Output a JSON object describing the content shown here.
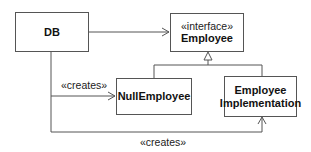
{
  "diagram": {
    "type": "uml-class-diagram",
    "classes": [
      {
        "id": "db",
        "name": "DB"
      },
      {
        "id": "employee",
        "stereotype": "«interface»",
        "name": "Employee"
      },
      {
        "id": "null_employee",
        "name": "NullEmployee"
      },
      {
        "id": "employee_impl",
        "name_line1": "Employee",
        "name_line2": "Implementation"
      }
    ],
    "relations": [
      {
        "from": "DB",
        "to": "Employee",
        "kind": "association"
      },
      {
        "from": "DB",
        "to": "NullEmployee",
        "kind": "dependency",
        "label": "«creates»"
      },
      {
        "from": "DB",
        "to": "Employee Implementation",
        "kind": "dependency",
        "label": "«creates»"
      },
      {
        "from": "NullEmployee",
        "to": "Employee",
        "kind": "realization"
      },
      {
        "from": "Employee Implementation",
        "to": "Employee",
        "kind": "realization"
      }
    ],
    "labels": {
      "creates_null": "«creates»",
      "creates_impl": "«creates»"
    }
  }
}
